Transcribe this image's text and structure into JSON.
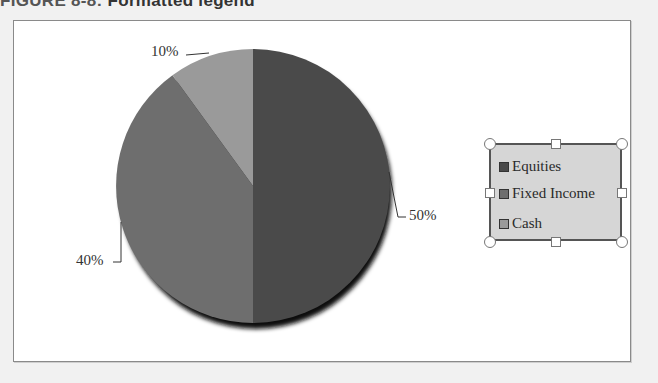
{
  "figure": {
    "label": "FIGURE 8-8:",
    "title": "Formatted legend"
  },
  "chart_data": {
    "type": "pie",
    "title": "",
    "categories": [
      "Equities",
      "Fixed Income",
      "Cash"
    ],
    "values": [
      50,
      40,
      10
    ],
    "data_labels": [
      "50%",
      "40%",
      "10%"
    ],
    "colors": [
      "#4a4a4a",
      "#6e6e6e",
      "#9a9a9a"
    ],
    "legend": {
      "position": "right",
      "selected": true,
      "background": "#d6d6d6",
      "entries": [
        "Equities",
        "Fixed Income",
        "Cash"
      ]
    },
    "start_angle_deg": 0,
    "direction": "clockwise"
  }
}
